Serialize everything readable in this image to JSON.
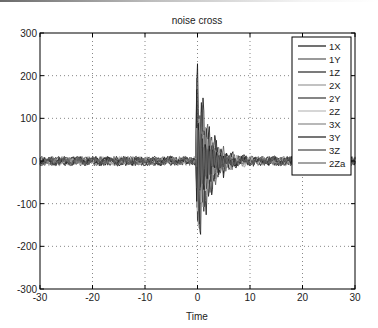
{
  "chart_data": {
    "type": "line",
    "title": "noise cross",
    "xlabel": "Time",
    "ylabel": "",
    "xlim": [
      -30,
      30
    ],
    "ylim": [
      -300,
      300
    ],
    "xticks": [
      -30,
      -20,
      -10,
      0,
      10,
      20,
      30
    ],
    "yticks": [
      300,
      200,
      100,
      0,
      -100,
      -200,
      -300
    ],
    "xtick_labels": [
      "-30",
      "-20",
      "-10",
      "0",
      "10",
      "20",
      "30"
    ],
    "ytick_labels": [
      "300",
      "200",
      "100",
      "0",
      "-100",
      "-200",
      "-300"
    ],
    "grid": true,
    "legend_position": "upper right",
    "legend": [
      "1X",
      "1Y",
      "1Z",
      "2X",
      "2Y",
      "2Z",
      "3X",
      "3Y",
      "3Z",
      "2Za"
    ],
    "series": [
      {
        "name": "1X",
        "color": "#111111",
        "peak": 230,
        "trough": -290,
        "peak_time": 0.2
      },
      {
        "name": "1Y",
        "color": "#555555",
        "peak": 195,
        "trough": -250,
        "peak_time": 1.3
      },
      {
        "name": "1Z",
        "color": "#222222",
        "peak": 180,
        "trough": -230,
        "peak_time": 0.4
      },
      {
        "name": "2X",
        "color": "#999999",
        "peak": 150,
        "trough": -200,
        "peak_time": 1.0
      },
      {
        "name": "2Y",
        "color": "#333333",
        "peak": 140,
        "trough": -180,
        "peak_time": 0.6
      },
      {
        "name": "2Z",
        "color": "#bbbbbb",
        "peak": 120,
        "trough": -160,
        "peak_time": 1.6
      },
      {
        "name": "3X",
        "color": "#888888",
        "peak": 110,
        "trough": -140,
        "peak_time": 2.0
      },
      {
        "name": "3Y",
        "color": "#1a1a1a",
        "peak": 100,
        "trough": -120,
        "peak_time": 0.8
      },
      {
        "name": "3Z",
        "color": "#444444",
        "peak": 90,
        "trough": -110,
        "peak_time": 2.4
      },
      {
        "name": "2Za",
        "color": "#666666",
        "peak": 80,
        "trough": -100,
        "peak_time": 1.8
      }
    ]
  },
  "plot": {
    "left": 40,
    "top": 33,
    "right": 355,
    "bottom": 289
  }
}
